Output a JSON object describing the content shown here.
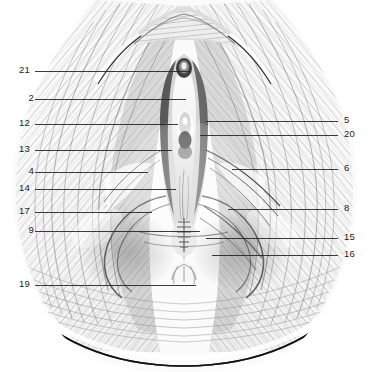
{
  "figure": {
    "background_color": "#ffffff",
    "ink_color": "#1d1d1d",
    "leader_color": "#262626",
    "medium": "graphite pencil shading illustration",
    "width": 369,
    "height": 372
  },
  "labels": {
    "left": [
      {
        "number": "21",
        "y": 71,
        "text_x": 14,
        "line_from": 35,
        "line_to": 190
      },
      {
        "number": "2",
        "y": 99,
        "text_x": 18,
        "line_from": 35,
        "line_to": 186
      },
      {
        "number": "12",
        "y": 124,
        "text_x": 14,
        "line_from": 35,
        "line_to": 178
      },
      {
        "number": "13",
        "y": 150,
        "text_x": 14,
        "line_from": 35,
        "line_to": 172
      },
      {
        "number": "4",
        "y": 172,
        "text_x": 18,
        "line_from": 35,
        "line_to": 148
      },
      {
        "number": "14",
        "y": 189,
        "text_x": 14,
        "line_from": 35,
        "line_to": 176
      },
      {
        "number": "17",
        "y": 212,
        "text_x": 14,
        "line_from": 35,
        "line_to": 152
      },
      {
        "number": "9",
        "y": 231,
        "text_x": 18,
        "line_from": 35,
        "line_to": 200
      },
      {
        "number": "19",
        "y": 285,
        "text_x": 14,
        "line_from": 35,
        "line_to": 196
      }
    ],
    "right": [
      {
        "number": "5",
        "y": 121,
        "text_x": 344,
        "line_from": 206,
        "line_to": 338
      },
      {
        "number": "20",
        "y": 135,
        "text_x": 344,
        "line_from": 200,
        "line_to": 338
      },
      {
        "number": "6",
        "y": 169,
        "text_x": 344,
        "line_from": 232,
        "line_to": 338
      },
      {
        "number": "8",
        "y": 209,
        "text_x": 344,
        "line_from": 228,
        "line_to": 338
      },
      {
        "number": "15",
        "y": 238,
        "text_x": 344,
        "line_from": 206,
        "line_to": 338
      },
      {
        "number": "16",
        "y": 255,
        "text_x": 344,
        "line_from": 212,
        "line_to": 338
      }
    ]
  },
  "legend_note": ""
}
